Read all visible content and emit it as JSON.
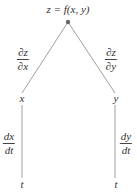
{
  "diagram": {
    "root": "z = f(x, y)",
    "edges": {
      "z_x": {
        "num": "∂z",
        "den": "∂x"
      },
      "z_y": {
        "num": "∂z",
        "den": "∂y"
      },
      "x_t": {
        "num": "dx",
        "den": "dt"
      },
      "y_t": {
        "num": "dy",
        "den": "dt"
      }
    },
    "nodes": {
      "x": "x",
      "y": "y",
      "t_left": "t",
      "t_right": "t"
    },
    "colors": {
      "line": "#777777",
      "dot": "#666666"
    }
  }
}
